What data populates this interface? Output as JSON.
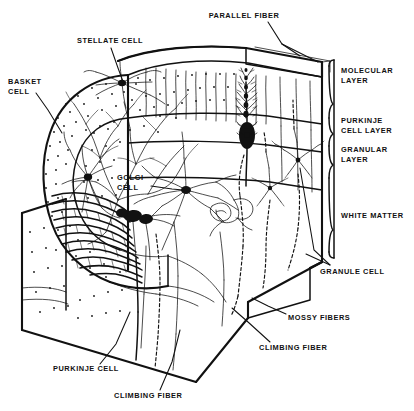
{
  "figure": {
    "background_color": "#ffffff",
    "ink_color": "#111111",
    "width": 414,
    "height": 411
  },
  "labels": {
    "parallel_fiber": "PARALLEL FIBER",
    "stellate_cell": "STELLATE CELL",
    "basket_cell_line1": "BASKET",
    "basket_cell_line2": "CELL",
    "golgi_cell_line1": "GOLGI",
    "golgi_cell_line2": "CELL",
    "molecular_layer_line1": "MOLECULAR",
    "molecular_layer_line2": "LAYER",
    "purkinje_cell_layer_line1": "PURKINJE",
    "purkinje_cell_layer_line2": "CELL LAYER",
    "granular_layer_line1": "GRANULAR",
    "granular_layer_line2": "LAYER",
    "white_matter": "WHITE MATTER",
    "granule_cell": "GRANULE CELL",
    "mossy_fibers": "MOSSY FIBERS",
    "climbing_fiber_right": "CLIMBING FIBER",
    "climbing_fiber_bottom": "CLIMBING FIBER",
    "purkinje_cell": "PURKINJE CELL"
  },
  "layers": [
    {
      "name": "MOLECULAR LAYER",
      "bracket_top": 57,
      "bracket_bottom": 118
    },
    {
      "name": "PURKINJE CELL LAYER",
      "bracket_top": 118,
      "bracket_bottom": 143
    },
    {
      "name": "GRANULAR LAYER",
      "bracket_top": 143,
      "bracket_bottom": 178
    },
    {
      "name": "WHITE MATTER",
      "bracket_top": 178,
      "bracket_bottom": 262
    }
  ],
  "cell_types": [
    "Stellate cell",
    "Basket cell",
    "Golgi cell",
    "Purkinje cell",
    "Granule cell"
  ],
  "fiber_types": [
    "Parallel fiber",
    "Climbing fiber",
    "Mossy fibers"
  ]
}
